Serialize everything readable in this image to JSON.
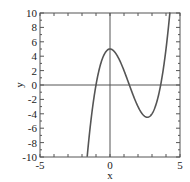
{
  "chart_data": {
    "type": "line",
    "title": "",
    "xlabel": "x",
    "ylabel": "y",
    "xlim": [
      -5,
      5
    ],
    "ylim": [
      -10,
      10
    ],
    "grid": false,
    "zero_lines": true,
    "x_ticks": [
      "-5",
      "0",
      "5"
    ],
    "y_ticks": [
      "10",
      "8",
      "6",
      "4",
      "2",
      "0",
      "-2",
      "-4",
      "-6",
      "-8",
      "-10"
    ],
    "series": [
      {
        "name": "y = x^3 - 4x^2 + 5",
        "color": "#555555",
        "x": [
          -1.63,
          -1.5,
          -1.0,
          -0.5,
          0.0,
          0.5,
          1.0,
          1.5,
          2.0,
          2.5,
          2.67,
          3.0,
          3.5,
          4.0,
          4.3
        ],
        "values": [
          -10.0,
          -7.4,
          0.0,
          3.9,
          5.0,
          4.1,
          2.0,
          -0.6,
          -3.0,
          -4.4,
          -4.5,
          -4.0,
          -1.1,
          5.0,
          10.0
        ]
      }
    ],
    "annotations": {
      "local_max": [
        0,
        5
      ],
      "local_min": [
        2.67,
        -4.48
      ]
    }
  }
}
